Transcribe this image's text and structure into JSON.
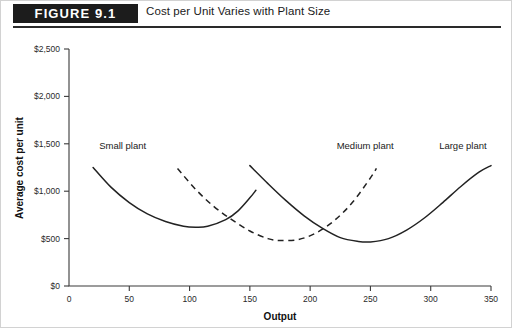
{
  "figure": {
    "label": "FIGURE 9.1",
    "title": "Cost per Unit Varies with Plant Size"
  },
  "chart_data": {
    "type": "line",
    "title": "Cost per Unit Varies with Plant Size",
    "xlabel": "Output",
    "ylabel": "Average cost per unit",
    "xlim": [
      0,
      350
    ],
    "ylim": [
      0,
      2500
    ],
    "xticks": [
      0,
      50,
      100,
      150,
      200,
      250,
      300,
      350
    ],
    "xtick_labels": [
      "0",
      "50",
      "100",
      "150",
      "200",
      "250",
      "300",
      "350"
    ],
    "yticks": [
      0,
      500,
      1000,
      1500,
      2000,
      2500
    ],
    "ytick_labels": [
      "$0",
      "$500",
      "$1,000",
      "$1,500",
      "$2,000",
      "$2,500"
    ],
    "grid": false,
    "legend": "inline-annotations",
    "series": [
      {
        "name": "Small plant",
        "style": "solid",
        "color": "#222222",
        "annotation": "Small plant",
        "x": [
          20,
          35,
          50,
          65,
          80,
          95,
          105,
          115,
          130,
          140,
          150,
          155
        ],
        "values": [
          1250,
          1040,
          880,
          760,
          680,
          630,
          620,
          630,
          700,
          790,
          930,
          1010
        ]
      },
      {
        "name": "Medium plant",
        "style": "dashed",
        "color": "#222222",
        "annotation": "Medium plant",
        "x": [
          90,
          105,
          120,
          135,
          150,
          165,
          175,
          190,
          205,
          220,
          235,
          250,
          255
        ],
        "values": [
          1240,
          1020,
          840,
          700,
          580,
          500,
          480,
          490,
          560,
          690,
          880,
          1140,
          1240
        ]
      },
      {
        "name": "Large plant",
        "style": "solid",
        "color": "#222222",
        "annotation": "Large plant",
        "x": [
          150,
          165,
          180,
          195,
          210,
          225,
          240,
          250,
          265,
          280,
          295,
          310,
          325,
          340,
          350
        ],
        "values": [
          1270,
          1080,
          900,
          740,
          610,
          510,
          470,
          465,
          500,
          590,
          720,
          880,
          1050,
          1200,
          1270
        ]
      }
    ],
    "annotations": [
      {
        "text": "Small plant",
        "x": 25,
        "y": 1450
      },
      {
        "text": "Medium plant",
        "x": 222,
        "y": 1450
      },
      {
        "text": "Large plant",
        "x": 307,
        "y": 1450
      }
    ]
  }
}
